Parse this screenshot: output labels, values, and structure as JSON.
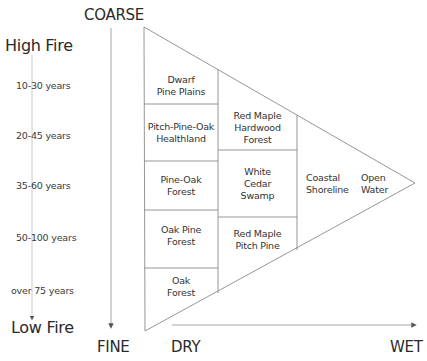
{
  "axes": {
    "vertical_left": {
      "top_label": "High Fire",
      "bottom_label": "Low Fire"
    },
    "vertical_right": {
      "top_label": "COARSE",
      "bottom_label": "FINE"
    },
    "horizontal": {
      "left_label": "DRY",
      "right_label": "WET"
    }
  },
  "fire_return_intervals": [
    "10-30 years",
    "20-45 years",
    "35-60 years",
    "50-100 years",
    "over 75 years"
  ],
  "communities": {
    "column1": [
      {
        "line1": "Dwarf",
        "line2": "Pine Plains"
      },
      {
        "line1": "Pitch-Pine-Oak",
        "line2": "Healthland"
      },
      {
        "line1": "Pine-Oak",
        "line2": "Forest"
      },
      {
        "line1": "Oak Pine",
        "line2": "Forest"
      },
      {
        "line1": "Oak",
        "line2": "Forest"
      }
    ],
    "column2": [
      {
        "line1": "Red Maple",
        "line2": "Hardwood",
        "line3": "Forest"
      },
      {
        "line1": "White",
        "line2": "Cedar",
        "line3": "Swamp"
      },
      {
        "line1": "Red Maple",
        "line2": "Pitch Pine"
      }
    ],
    "column3": [
      {
        "line1": "Coastal",
        "line2": "Shoreline"
      },
      {
        "line1": "Open",
        "line2": "Water"
      }
    ]
  },
  "colors": {
    "line": "#8a8a8a",
    "text": "#333333",
    "background": "#ffffff"
  }
}
